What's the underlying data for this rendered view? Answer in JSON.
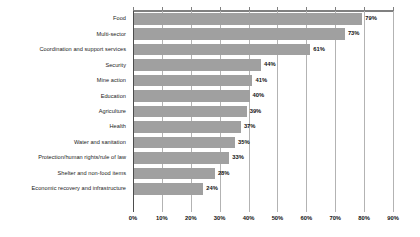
{
  "chart_data": {
    "type": "bar",
    "orientation": "horizontal",
    "title": "",
    "subtitle": "",
    "xlabel": "",
    "ylabel": "",
    "xlim": [
      0,
      90
    ],
    "grid": true,
    "legend": false,
    "legend_position": "none",
    "value_suffix": "%",
    "bar_color": "#a0a0a0",
    "gridline_color": "#b3b3b3",
    "axis_color": "#4d4d4d",
    "categories": [
      "Food",
      "Multi-sector",
      "Coordination and support services",
      "Security",
      "Mine action",
      "Education",
      "Agriculture",
      "Health",
      "Water and sanitation",
      "Protection/human rights/rule of law",
      "Shelter and non-food items",
      "Economic recovery and infrastructure"
    ],
    "values": [
      79,
      73,
      61,
      44,
      41,
      40,
      39,
      37,
      35,
      33,
      28,
      24
    ],
    "value_labels": [
      "79%",
      "73%",
      "61%",
      "44%",
      "41%",
      "40%",
      "39%",
      "37%",
      "35%",
      "33%",
      "28%",
      "24%"
    ],
    "xticks": [
      0,
      10,
      20,
      30,
      40,
      50,
      60,
      70,
      80,
      90
    ],
    "xtick_labels": [
      "0%",
      "10%",
      "20%",
      "30%",
      "40%",
      "50%",
      "60%",
      "70%",
      "80%",
      "90%"
    ]
  }
}
